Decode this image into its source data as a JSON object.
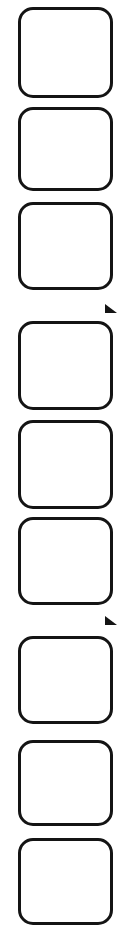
{
  "canvas": {
    "width": 136,
    "height": 938,
    "background_color": "#ffffff"
  },
  "style": {
    "stroke_color": "#141414",
    "fill_color": "#ffffff",
    "stroke_width_px": 3,
    "corner_radius_px": 15,
    "tick_color": "#141414"
  },
  "column": {
    "item_count": 9,
    "item_width_px": 95,
    "item_left_px": 18,
    "items": [
      {
        "index": 1,
        "label": "",
        "top_px": 7,
        "height_px": 91,
        "content": ""
      },
      {
        "index": 2,
        "label": "",
        "top_px": 107,
        "height_px": 84,
        "content": ""
      },
      {
        "index": 3,
        "label": "",
        "top_px": 202,
        "height_px": 88,
        "content": ""
      },
      {
        "index": 4,
        "label": "",
        "top_px": 321,
        "height_px": 89,
        "content": ""
      },
      {
        "index": 5,
        "label": "",
        "top_px": 420,
        "height_px": 89,
        "content": ""
      },
      {
        "index": 6,
        "label": "",
        "top_px": 517,
        "height_px": 88,
        "content": ""
      },
      {
        "index": 7,
        "label": "",
        "top_px": 636,
        "height_px": 88,
        "content": ""
      },
      {
        "index": 8,
        "label": "",
        "top_px": 740,
        "height_px": 86,
        "content": ""
      },
      {
        "index": 9,
        "label": "",
        "top_px": 838,
        "height_px": 87,
        "content": ""
      }
    ]
  },
  "marks": [
    {
      "name": "tick-mark-1",
      "left_px": 105,
      "top_px": 304,
      "size_px": 12,
      "after_item_index": 3
    },
    {
      "name": "tick-mark-2",
      "left_px": 105,
      "top_px": 616,
      "size_px": 12,
      "after_item_index": 6
    }
  ]
}
